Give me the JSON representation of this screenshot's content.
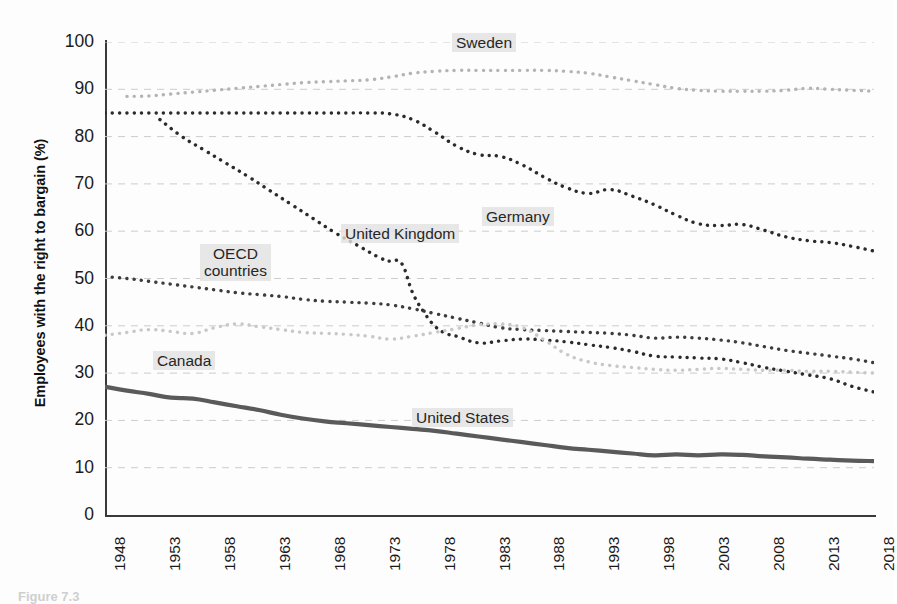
{
  "figure": {
    "caption": "Figure 7.3"
  },
  "axes": {
    "ylabel": "Employees with the right to bargain (%)",
    "xlabel": "",
    "yticks": [
      0,
      10,
      20,
      30,
      40,
      50,
      60,
      70,
      80,
      90,
      100
    ],
    "xticks": [
      1948,
      1953,
      1958,
      1963,
      1968,
      1973,
      1978,
      1983,
      1988,
      1993,
      1998,
      2003,
      2008,
      2013,
      2018
    ]
  },
  "colors": {
    "sweden": "#b4b4b4",
    "germany": "#2b2b2b",
    "united_kingdom": "#2b2b2b",
    "oecd_countries": "#3d3d3d",
    "canada": "#c8c8c8",
    "united_states": "#5a5a5a",
    "gridline": "#cccccc",
    "axis": "#3a3a3a",
    "label_highlight": "#e2e2e2"
  },
  "labels": {
    "sweden": "Sweden",
    "germany": "Germany",
    "united_kingdom": "United Kingdom",
    "oecd_countries": "OECD\ncountries",
    "oecd_countries_line1": "OECD",
    "oecd_countries_line2": "countries",
    "canada": "Canada",
    "united_states": "United States"
  },
  "chart_data": {
    "type": "line",
    "title": "",
    "xlabel": "",
    "ylabel": "Employees with the right to bargain (%)",
    "xlim": [
      1948,
      2018
    ],
    "ylim": [
      0,
      100
    ],
    "grid": true,
    "legend_position": "inline-labels",
    "xticks": [
      1948,
      1953,
      1958,
      1963,
      1968,
      1973,
      1978,
      1983,
      1988,
      1993,
      1998,
      2003,
      2008,
      2013,
      2018
    ],
    "yticks": [
      0,
      10,
      20,
      30,
      40,
      50,
      60,
      70,
      80,
      90,
      100
    ],
    "series": [
      {
        "name": "Sweden",
        "style": "dotted",
        "color": "#b4b4b4",
        "x": [
          1950,
          1952,
          1954,
          1956,
          1958,
          1960,
          1962,
          1964,
          1966,
          1968,
          1970,
          1972,
          1974,
          1976,
          1978,
          1980,
          1982,
          1984,
          1986,
          1988,
          1990,
          1992,
          1994,
          1996,
          1998,
          2000,
          2002,
          2004,
          2006,
          2008,
          2010,
          2012,
          2014,
          2016,
          2018
        ],
        "values": [
          88.5,
          88.6,
          89.0,
          89.4,
          89.8,
          90.2,
          90.6,
          91.0,
          91.4,
          91.6,
          91.8,
          92.0,
          92.6,
          93.4,
          93.8,
          94.0,
          94.0,
          94.0,
          94.0,
          94.0,
          93.8,
          93.4,
          92.6,
          91.8,
          91.0,
          90.2,
          89.8,
          89.6,
          89.6,
          89.6,
          89.8,
          90.2,
          90.0,
          89.8,
          89.6
        ]
      },
      {
        "name": "Germany",
        "style": "dotted",
        "color": "#2b2b2b",
        "x": [
          1948,
          1950,
          1952,
          1954,
          1956,
          1958,
          1960,
          1962,
          1964,
          1966,
          1968,
          1970,
          1972,
          1974,
          1976,
          1978,
          1980,
          1982,
          1984,
          1986,
          1988,
          1990,
          1992,
          1994,
          1996,
          1998,
          2000,
          2002,
          2004,
          2006,
          2008,
          2010,
          2012,
          2014,
          2016,
          2018
        ],
        "values": [
          85.0,
          85.0,
          85.0,
          85.0,
          85.0,
          85.0,
          85.0,
          85.0,
          85.0,
          85.0,
          85.0,
          85.0,
          85.0,
          84.8,
          83.6,
          81.0,
          78.0,
          76.2,
          75.8,
          74.0,
          71.4,
          69.2,
          68.0,
          68.8,
          67.4,
          65.6,
          63.4,
          61.6,
          61.2,
          61.4,
          60.2,
          58.8,
          58.0,
          57.6,
          56.8,
          55.8
        ]
      },
      {
        "name": "United Kingdom",
        "style": "dotted",
        "color": "#2b2b2b",
        "x": [
          1953,
          1955,
          1957,
          1959,
          1961,
          1963,
          1965,
          1967,
          1969,
          1971,
          1973,
          1974,
          1975,
          1976,
          1977,
          1978,
          1979,
          1980,
          1982,
          1984,
          1986,
          1988,
          1990,
          1992,
          1994,
          1996,
          1998,
          2000,
          2002,
          2004,
          2006,
          2008,
          2010,
          2012,
          2014,
          2016,
          2018
        ],
        "values": [
          83.6,
          80.0,
          77.2,
          74.4,
          71.6,
          68.6,
          65.6,
          62.6,
          59.6,
          57.0,
          54.4,
          53.6,
          53.2,
          47.0,
          43.0,
          40.0,
          38.4,
          37.8,
          36.4,
          36.8,
          37.2,
          37.0,
          36.6,
          36.0,
          35.4,
          34.6,
          33.6,
          33.4,
          33.2,
          33.0,
          32.2,
          31.2,
          30.4,
          29.6,
          28.8,
          27.2,
          26.0
        ]
      },
      {
        "name": "OECD countries",
        "style": "dotted",
        "color": "#3d3d3d",
        "x": [
          1948,
          1950,
          1952,
          1954,
          1956,
          1958,
          1960,
          1962,
          1964,
          1966,
          1968,
          1970,
          1972,
          1974,
          1976,
          1978,
          1980,
          1982,
          1984,
          1986,
          1988,
          1990,
          1992,
          1994,
          1996,
          1998,
          2000,
          2002,
          2004,
          2006,
          2008,
          2010,
          2012,
          2014,
          2016,
          2018
        ],
        "values": [
          50.4,
          50.0,
          49.4,
          48.8,
          48.2,
          47.6,
          47.0,
          46.6,
          46.2,
          45.6,
          45.2,
          45.0,
          44.8,
          44.4,
          43.6,
          42.6,
          41.6,
          40.6,
          39.6,
          39.2,
          39.0,
          38.8,
          38.6,
          38.4,
          38.0,
          37.4,
          37.6,
          37.4,
          37.0,
          36.4,
          35.6,
          34.8,
          34.2,
          33.6,
          33.0,
          32.2
        ]
      },
      {
        "name": "Canada",
        "style": "dotted",
        "color": "#c8c8c8",
        "x": [
          1948,
          1950,
          1952,
          1954,
          1956,
          1958,
          1960,
          1962,
          1964,
          1966,
          1968,
          1970,
          1972,
          1974,
          1976,
          1978,
          1980,
          1982,
          1984,
          1986,
          1988,
          1990,
          1992,
          1994,
          1996,
          1998,
          2000,
          2002,
          2004,
          2006,
          2008,
          2010,
          2012,
          2014,
          2016,
          2018
        ],
        "values": [
          38.0,
          38.6,
          39.2,
          38.8,
          38.4,
          39.6,
          40.4,
          39.8,
          39.2,
          38.6,
          38.4,
          38.2,
          37.8,
          37.2,
          37.8,
          38.6,
          39.4,
          40.2,
          40.4,
          39.6,
          37.0,
          34.0,
          32.4,
          31.6,
          31.2,
          30.8,
          30.6,
          30.8,
          31.0,
          30.8,
          30.6,
          30.6,
          30.4,
          30.4,
          30.2,
          30.0
        ]
      },
      {
        "name": "United States",
        "style": "solid",
        "color": "#5a5a5a",
        "x": [
          1948,
          1950,
          1952,
          1954,
          1956,
          1958,
          1960,
          1962,
          1964,
          1966,
          1968,
          1970,
          1972,
          1974,
          1976,
          1978,
          1980,
          1982,
          1984,
          1986,
          1988,
          1990,
          1992,
          1994,
          1996,
          1998,
          2000,
          2002,
          2004,
          2006,
          2008,
          2010,
          2012,
          2014,
          2016,
          2018
        ],
        "values": [
          27.1,
          26.3,
          25.6,
          24.8,
          24.6,
          23.8,
          23.0,
          22.2,
          21.2,
          20.4,
          19.8,
          19.4,
          19.0,
          18.6,
          18.2,
          17.8,
          17.2,
          16.6,
          16.0,
          15.4,
          14.8,
          14.2,
          13.8,
          13.4,
          13.0,
          12.6,
          12.8,
          12.6,
          12.8,
          12.7,
          12.4,
          12.2,
          11.9,
          11.7,
          11.5,
          11.4
        ]
      }
    ]
  }
}
